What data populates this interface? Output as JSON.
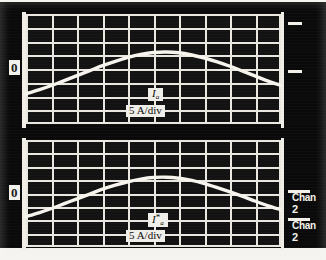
{
  "instrument": {
    "type": "oscilloscope-photo",
    "panels": 2,
    "zero_marker_label": "0"
  },
  "top_panel": {
    "name": "channel-a-current",
    "zero_label": "0",
    "signal_label": "I",
    "signal_subscript": "a",
    "signal_superscript": "",
    "scale_label": "5 A/div",
    "channel_label": "Chan",
    "channel_number": "2"
  },
  "bottom_panel": {
    "name": "channel-a-reference-current",
    "zero_label": "0",
    "signal_label": "I",
    "signal_subscript": "a",
    "signal_superscript": "*",
    "scale_label": "5 A/div",
    "channel_label": "Chan",
    "channel_number": "2"
  },
  "colors": {
    "screen_background": "#0a0a0a",
    "graticule": "#e9e7df",
    "trace": "#f6f4ec",
    "label_background": "#efeee8",
    "label_text": "#0b0b0b",
    "page_background": "#f4f3ef"
  },
  "chart_data": {
    "type": "line",
    "xlabel": "",
    "ylabel": "",
    "grid": true,
    "legend": "none",
    "divisions": {
      "horizontal": 10,
      "vertical": 8
    },
    "y_scale_per_div": 5,
    "y_units": "A",
    "series": [
      {
        "name": "Ia",
        "panel": "top",
        "units": "A",
        "scale_per_div": 5,
        "zero_div_from_top": 4,
        "x": [
          0,
          0.5,
          1,
          1.5,
          2,
          2.5,
          3,
          3.5,
          4,
          4.5,
          5,
          5.5,
          6,
          6.5,
          7,
          7.5,
          8,
          8.5,
          9,
          9.5,
          10
        ],
        "values": [
          -9.0,
          -7.6,
          -6.0,
          -4.2,
          -2.4,
          -0.6,
          1.2,
          2.8,
          4.2,
          5.3,
          6.0,
          6.2,
          5.9,
          5.1,
          4.0,
          2.6,
          1.0,
          -0.8,
          -2.6,
          -4.4,
          -6.0
        ]
      },
      {
        "name": "Ia*",
        "panel": "bottom",
        "units": "A",
        "scale_per_div": 5,
        "zero_div_from_top": 4,
        "x": [
          0,
          0.5,
          1,
          1.5,
          2,
          2.5,
          3,
          3.5,
          4,
          4.5,
          5,
          5.5,
          6,
          6.5,
          7,
          7.5,
          8,
          8.5,
          9,
          9.5,
          10
        ],
        "values": [
          -8.6,
          -7.2,
          -5.6,
          -3.8,
          -2.0,
          -0.2,
          1.6,
          3.1,
          4.4,
          5.4,
          6.0,
          6.1,
          5.7,
          4.9,
          3.7,
          2.2,
          0.6,
          -1.1,
          -2.9,
          -4.6,
          -6.1
        ]
      }
    ]
  }
}
